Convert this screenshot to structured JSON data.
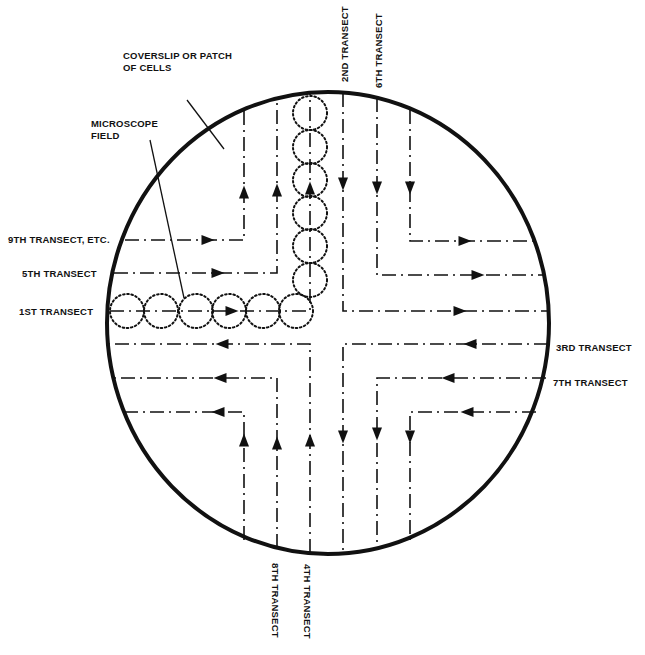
{
  "colors": {
    "ink": "#111111",
    "background": "#ffffff"
  },
  "coverslip": {
    "cx": 328,
    "cy": 323,
    "rx": 221,
    "ry": 231
  },
  "labels": {
    "coverslip": [
      "COVERSLIP OR PATCH",
      "OF CELLS"
    ],
    "microscope_field": [
      "MICROSCOPE",
      "FIELD"
    ],
    "transect_1": "1ST TRANSECT",
    "transect_2": "2ND TRANSECT",
    "transect_3": "3RD TRANSECT",
    "transect_4": "4TH TRANSECT",
    "transect_5": "5TH TRANSECT",
    "transect_6": "6TH TRANSECT",
    "transect_7": "7TH TRANSECT",
    "transect_8": "8TH TRANSECT",
    "transect_9": "9TH TRANSECT, ETC."
  },
  "paths": [
    {
      "name": "path-1st-transect",
      "points": [
        [
          110,
          311
        ],
        [
          310,
          311
        ],
        [
          310,
          93
        ]
      ],
      "arrows": [
        [
          232,
          311,
          "right"
        ],
        [
          310,
          188,
          "up"
        ]
      ]
    },
    {
      "name": "path-5th-transect",
      "points": [
        [
          114,
          273
        ],
        [
          277,
          273
        ],
        [
          277,
          98
        ]
      ],
      "arrows": [
        [
          218,
          273,
          "right"
        ],
        [
          277,
          190,
          "up"
        ]
      ]
    },
    {
      "name": "path-9th-transect",
      "points": [
        [
          125,
          240
        ],
        [
          244,
          240
        ],
        [
          244,
          110
        ]
      ],
      "arrows": [
        [
          208,
          240,
          "right"
        ],
        [
          244,
          192,
          "up"
        ]
      ]
    },
    {
      "name": "path-2nd-transect",
      "points": [
        [
          343,
          93
        ],
        [
          343,
          311
        ],
        [
          548,
          311
        ]
      ],
      "arrows": [
        [
          343,
          184,
          "down"
        ],
        [
          460,
          311,
          "right"
        ]
      ]
    },
    {
      "name": "path-6th-transect",
      "points": [
        [
          377,
          98
        ],
        [
          377,
          275
        ],
        [
          546,
          275
        ]
      ],
      "arrows": [
        [
          377,
          188,
          "down"
        ],
        [
          478,
          275,
          "right"
        ]
      ]
    },
    {
      "name": "path-10th-transect",
      "points": [
        [
          410,
          110
        ],
        [
          410,
          241
        ],
        [
          536,
          241
        ]
      ],
      "arrows": [
        [
          410,
          188,
          "down"
        ],
        [
          465,
          241,
          "right"
        ]
      ]
    },
    {
      "name": "path-3rd-transect",
      "points": [
        [
          548,
          344
        ],
        [
          343,
          344
        ],
        [
          343,
          552
        ]
      ],
      "arrows": [
        [
          470,
          344,
          "left"
        ],
        [
          343,
          437,
          "down"
        ]
      ]
    },
    {
      "name": "path-7th-transect",
      "points": [
        [
          546,
          378
        ],
        [
          377,
          378
        ],
        [
          377,
          548
        ]
      ],
      "arrows": [
        [
          448,
          378,
          "left"
        ],
        [
          377,
          434,
          "down"
        ]
      ]
    },
    {
      "name": "path-11th-transect",
      "points": [
        [
          536,
          412
        ],
        [
          410,
          412
        ],
        [
          410,
          540
        ]
      ],
      "arrows": [
        [
          467,
          412,
          "left"
        ],
        [
          410,
          437,
          "down"
        ]
      ]
    },
    {
      "name": "path-4th-transect",
      "points": [
        [
          310,
          553
        ],
        [
          310,
          344
        ],
        [
          108,
          344
        ]
      ],
      "arrows": [
        [
          310,
          440,
          "up"
        ],
        [
          222,
          344,
          "left"
        ]
      ]
    },
    {
      "name": "path-8th-transect",
      "points": [
        [
          277,
          548
        ],
        [
          277,
          378
        ],
        [
          112,
          378
        ]
      ],
      "arrows": [
        [
          277,
          443,
          "up"
        ],
        [
          220,
          378,
          "left"
        ]
      ]
    },
    {
      "name": "path-12th-transect",
      "points": [
        [
          244,
          540
        ],
        [
          244,
          412
        ],
        [
          125,
          412
        ]
      ],
      "arrows": [
        [
          244,
          440,
          "up"
        ],
        [
          218,
          412,
          "left"
        ]
      ]
    }
  ],
  "microscope_fields": {
    "radius": 17,
    "centers": [
      [
        127,
        311
      ],
      [
        161,
        311
      ],
      [
        196,
        311
      ],
      [
        229,
        311
      ],
      [
        263,
        311
      ],
      [
        296,
        311
      ],
      [
        310,
        280
      ],
      [
        310,
        246
      ],
      [
        310,
        213
      ],
      [
        310,
        180
      ],
      [
        310,
        147
      ],
      [
        310,
        113
      ]
    ]
  },
  "leaders": [
    {
      "name": "coverslip-leader",
      "from": [
        187,
        100
      ],
      "to": [
        224,
        149
      ]
    },
    {
      "name": "microscope-field-leader",
      "from": [
        150,
        140
      ],
      "to": [
        184,
        298
      ]
    }
  ]
}
